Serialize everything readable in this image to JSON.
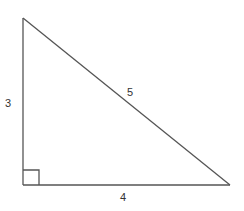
{
  "diagram": {
    "type": "right-triangle",
    "stroke_color": "#555555",
    "label_color": "#333333",
    "vertices": {
      "top": [
        23,
        18
      ],
      "right_angle": [
        23,
        185
      ],
      "right": [
        230,
        185
      ]
    },
    "right_angle_marker_size": 16,
    "sides": [
      {
        "name": "vertical-leg",
        "label": "3",
        "label_pos": [
          9,
          107
        ]
      },
      {
        "name": "hypotenuse",
        "label": "5",
        "label_pos": [
          127,
          96
        ]
      },
      {
        "name": "horizontal-leg",
        "label": "4",
        "label_pos": [
          121,
          201
        ]
      }
    ]
  }
}
